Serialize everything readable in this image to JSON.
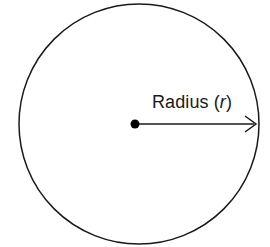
{
  "figure": {
    "background_color": "#ffffff",
    "stroke_color": "#1a1a1a",
    "canvas": {
      "width": 270,
      "height": 247
    },
    "label": {
      "full_text": "Radius (r)",
      "text_prefix": "Radius (",
      "variable": "r",
      "text_suffix": ")",
      "x": 152,
      "y": 108,
      "font_size": 18,
      "variable_style": "italic"
    },
    "circle": {
      "center_x": 139,
      "center_y": 124,
      "radius": 120,
      "stroke_width": 1.5,
      "fill": "none"
    },
    "center_point": {
      "x": 135,
      "y": 124,
      "diameter": 9,
      "fill": "#000000"
    },
    "radius_arrow": {
      "start_x": 137,
      "start_y": 124,
      "end_x": 256,
      "end_y": 124,
      "stroke_width": 1.5,
      "arrowhead": "open-v"
    }
  }
}
